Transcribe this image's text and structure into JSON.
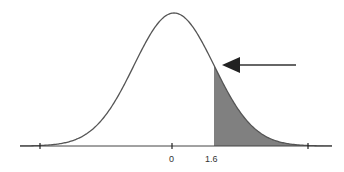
{
  "chart_data": {
    "type": "area",
    "title": "",
    "xlabel": "",
    "ylabel": "",
    "distribution": {
      "name": "standard normal",
      "mean": 0,
      "sd": 1
    },
    "shaded_region": {
      "from": 1.6,
      "to": "infinity",
      "side": "right"
    },
    "tick_labels": [
      "0",
      "1.6"
    ],
    "tick_values": [
      0,
      1.6
    ],
    "unlabeled_ticks": [
      -3.3,
      3.3
    ],
    "annotation": {
      "type": "arrow",
      "direction": "left",
      "points_to": "shaded tail region"
    },
    "colors": {
      "curve": "#555555",
      "shade": "#808080",
      "axis": "#444444"
    }
  },
  "labels": {
    "zero": "0",
    "cutoff": "1.6"
  }
}
